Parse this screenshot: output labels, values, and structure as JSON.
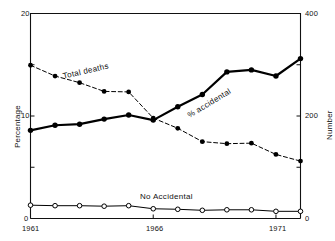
{
  "chart_data": {
    "type": "line",
    "title": "",
    "subtitle": "",
    "xlabel": "",
    "ylabel": "Percentage",
    "y2label": "Number",
    "x": [
      1961,
      1962,
      1963,
      1964,
      1965,
      1966,
      1967,
      1968,
      1969,
      1970,
      1971,
      1972
    ],
    "xlim": [
      1961,
      1972
    ],
    "ylim": [
      0,
      20
    ],
    "y2lim": [
      0,
      400
    ],
    "xticks": [
      1961,
      1966,
      1971
    ],
    "xtick_labels": [
      "1961",
      "1966",
      "1971"
    ],
    "yticks": [
      0,
      10,
      20
    ],
    "ytick_labels": [
      "0",
      "10",
      "20"
    ],
    "yticks_minor": [
      5,
      15
    ],
    "y2ticks": [
      0,
      200,
      400
    ],
    "y2tick_labels": [
      "0",
      "200",
      "400"
    ],
    "y2ticks_minor": [
      100,
      300
    ],
    "grid": false,
    "legend": "inline-annotations",
    "series": [
      {
        "name": "% accidental",
        "axis": "left",
        "units": "percentage",
        "line_style": "solid",
        "line_width": 2.2,
        "marker": "filled-circle",
        "color": "#000000",
        "label_text": "% accidental",
        "values": [
          8.6,
          9.1,
          9.2,
          9.7,
          10.1,
          9.6,
          10.9,
          12.1,
          14.3,
          14.5,
          13.9,
          15.6
        ]
      },
      {
        "name": "Total deaths",
        "axis": "right",
        "units": "number",
        "line_style": "dashed",
        "line_width": 1,
        "marker": "filled-circle",
        "color": "#000000",
        "label_text": "Total deaths",
        "values": [
          299,
          278,
          265,
          248,
          247,
          196,
          176,
          150,
          146,
          147,
          125,
          112
        ]
      },
      {
        "name": "No Accidental",
        "axis": "right",
        "units": "number",
        "line_style": "solid",
        "line_width": 1,
        "marker": "open-circle",
        "color": "#000000",
        "label_text": "No Accidental",
        "values": [
          26,
          25,
          25,
          24,
          25,
          19,
          18,
          16,
          17,
          17,
          14,
          14
        ]
      }
    ],
    "annotations": [
      {
        "text": "Total deaths",
        "series": "Total deaths"
      },
      {
        "text": "% accidental",
        "series": "% accidental"
      },
      {
        "text": "No Accidental",
        "series": "No Accidental"
      }
    ]
  }
}
